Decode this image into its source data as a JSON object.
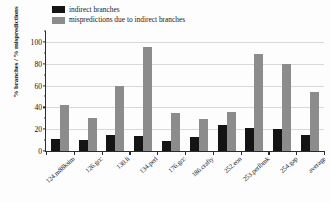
{
  "chart_data": {
    "type": "bar",
    "title": "",
    "xlabel": "",
    "ylabel": "% branches / % mispredictions",
    "ylim": [
      0,
      110
    ],
    "yticks": [
      0,
      20,
      40,
      60,
      80,
      100
    ],
    "ytick_labels": [
      "0",
      "20",
      "40",
      "60",
      "80",
      "100"
    ],
    "grid": true,
    "legend_position": "top-left",
    "categories": [
      "124.m88ksim",
      "126.gcc",
      "130.li",
      "134.perl",
      "176.gcc",
      "186.crafty",
      "252.eon",
      "253.perlbmk",
      "254.gap",
      "average"
    ],
    "series": [
      {
        "name": "indirect branches",
        "color": "#141414",
        "values": [
          11,
          10.5,
          15,
          14,
          9,
          12.5,
          24,
          21,
          20.5,
          15
        ]
      },
      {
        "name": "mispredictions due to indirect branches",
        "color": "#8c8c8c",
        "values": [
          42,
          30,
          60,
          95,
          35,
          29,
          35.5,
          89,
          80,
          54.5
        ]
      }
    ]
  },
  "legend": {
    "items": [
      {
        "label": "indirect branches",
        "swatch": "dark"
      },
      {
        "label": "mispredictions due to indirect branches",
        "swatch": "gray"
      }
    ]
  },
  "axes": {
    "y_title": "% branches / % mispredictions"
  }
}
